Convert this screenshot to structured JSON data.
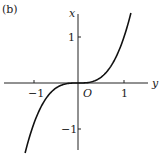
{
  "panel_label": "(b)",
  "chart_data": {
    "type": "line",
    "title": "",
    "xlabel": "y",
    "ylabel": "x",
    "origin_label": "O",
    "xticks": [
      -1,
      1
    ],
    "yticks": [
      1,
      -1
    ],
    "xtick_labels": [
      "−1",
      "1"
    ],
    "ytick_labels": [
      "1",
      "−1"
    ],
    "xlim": [
      -1.7,
      1.6
    ],
    "ylim": [
      -1.55,
      1.8
    ],
    "grid": false,
    "series": [
      {
        "name": "x = y^3",
        "x": [
          -1.15,
          -1.0,
          -0.8,
          -0.6,
          -0.4,
          -0.2,
          0,
          0.2,
          0.4,
          0.6,
          0.8,
          1.0,
          1.15
        ],
        "values": [
          -1.52,
          -1.0,
          -0.512,
          -0.216,
          -0.064,
          -0.008,
          0,
          0.008,
          0.064,
          0.216,
          0.512,
          1.0,
          1.52
        ]
      }
    ]
  }
}
